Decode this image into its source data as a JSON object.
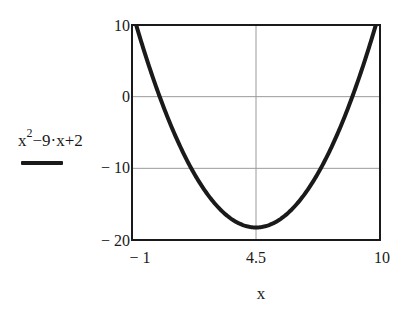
{
  "chart_data": {
    "type": "line",
    "title": "",
    "xlabel": "x",
    "ylabel": "",
    "xlim": [
      -1,
      10
    ],
    "ylim": [
      -20,
      10
    ],
    "x_ticks": [
      "-1",
      "4.5",
      "10"
    ],
    "y_ticks": [
      "10",
      "0",
      "-10",
      "-20"
    ],
    "grid": {
      "vertical": [
        4.5
      ],
      "horizontal": [
        0,
        -10
      ]
    },
    "legend_position": "left",
    "series": [
      {
        "name": "x^2-9·x+2",
        "expression": "x^2 - 9*x + 2",
        "color": "#1a1a1a",
        "x": [
          -1,
          -0.815,
          0,
          1,
          2,
          3,
          4,
          4.5,
          5,
          6,
          7,
          8,
          9,
          9.815,
          10
        ],
        "values": [
          12,
          10,
          2,
          -6,
          -12,
          -16,
          -18,
          -18.25,
          -18,
          -16,
          -12,
          -6,
          2,
          10,
          12
        ]
      }
    ]
  },
  "axes": {
    "y_tick_labels": {
      "t10": "10",
      "t0": "0",
      "tm10": "− 10",
      "tm20": "− 20"
    },
    "x_tick_labels": {
      "tm1": "− 1",
      "t45": "4.5",
      "t10": "10"
    },
    "x_title": "x"
  },
  "legend": {
    "base": "x",
    "exponent": "2",
    "rest": "−9·x+2"
  },
  "colors": {
    "curve": "#1a1a1a",
    "frame": "#1a1a1a",
    "grid": "#9a9a9a",
    "background": "#ffffff"
  }
}
